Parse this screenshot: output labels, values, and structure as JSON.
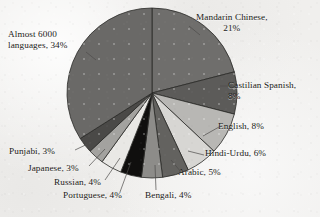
{
  "chart_data": {
    "type": "pie",
    "title": "",
    "subtitle": "",
    "xlabel": "",
    "ylabel": "",
    "grid": false,
    "legend_position": "none",
    "label_format": "name, percent",
    "start_angle_deg": 0,
    "direction": "clockwise",
    "center": {
      "cx": 152,
      "cy": 93,
      "r": 85
    },
    "categories": [
      "Mandarin Chinese",
      "Castilian Spanish",
      "English",
      "Hindi-Urdu",
      "Arabic",
      "Bengali",
      "Portuguese",
      "Russian",
      "Japanese",
      "Punjabi",
      "Almost 6000 languages"
    ],
    "values": [
      21,
      8,
      8,
      6,
      5,
      4,
      4,
      4,
      3,
      3,
      34
    ],
    "slices": [
      {
        "name": "Mandarin Chinese",
        "value": 21,
        "label": "Mandarin Chinese, 21%",
        "color": "#6f6e6c"
      },
      {
        "name": "Castilian Spanish",
        "value": 8,
        "label": "Castilian Spanish, 8%",
        "color": "#5c5b59"
      },
      {
        "name": "English",
        "value": 8,
        "label": "English, 8%",
        "color": "#b8b7b4"
      },
      {
        "name": "Hindi-Urdu",
        "value": 6,
        "label": "Hindi-Urdu, 6%",
        "color": "#d7d6d3"
      },
      {
        "name": "Arabic",
        "value": 5,
        "label": "Arabic, 5%",
        "color": "#63625f"
      },
      {
        "name": "Bengali",
        "value": 4,
        "label": "Bengali, 4%",
        "color": "#8d8c89"
      },
      {
        "name": "Portuguese",
        "value": 4,
        "label": "Portuguese, 4%",
        "color": "#100f0e"
      },
      {
        "name": "Russian",
        "value": 4,
        "label": "Russian, 4%",
        "color": "#e9e8e5"
      },
      {
        "name": "Japanese",
        "value": 3,
        "label": "Japanese, 3%",
        "color": "#a3a29f"
      },
      {
        "name": "Punjabi",
        "value": 3,
        "label": "Punjabi, 3%",
        "color": "#4a4947"
      },
      {
        "name": "Almost 6000 languages",
        "value": 34,
        "label": "Almost 6000 languages, 34%",
        "color": "#6a6967"
      }
    ]
  },
  "labels": {
    "mandarin_line1": "Mandarin Chinese,",
    "mandarin_line2": "21%",
    "almost_line1": "Almost 6000",
    "almost_line2": "languages, 34%",
    "castilian_line1": "Castilian Spanish,",
    "castilian_line2": "8%",
    "english": "English, 8%",
    "hindi": "Hindi-Urdu, 6%",
    "arabic": "Arabic, 5%",
    "bengali": "Bengali, 4%",
    "portuguese": "Portuguese, 4%",
    "russian": "Russian, 4%",
    "japanese": "Japanese, 3%",
    "punjabi": "Punjabi, 3%"
  },
  "style": {
    "background": "#f0efed",
    "text_color": "#1b1a18",
    "slice_outline": "#2a2927",
    "leader_line": "#4d4c4a"
  }
}
